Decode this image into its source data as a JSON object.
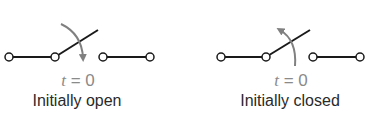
{
  "panels": [
    {
      "id": "open",
      "time_var": "t",
      "time_eq": "= 0",
      "caption": "Initially open",
      "arrow_direction": "down"
    },
    {
      "id": "closed",
      "time_var": "t",
      "time_eq": "= 0",
      "caption": "Initially closed",
      "arrow_direction": "up"
    }
  ],
  "colors": {
    "wire": "#1a1a1a",
    "arrow": "#808080",
    "time_label": "#8a8a8a",
    "caption": "#2a2a2a"
  }
}
